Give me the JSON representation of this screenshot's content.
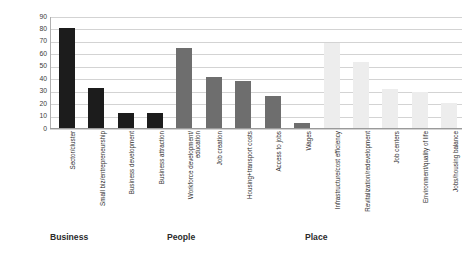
{
  "chart_data": {
    "type": "bar",
    "title": "",
    "xlabel": "",
    "ylabel": "Number of Applications",
    "ylim": [
      0,
      90
    ],
    "ytick_step": 10,
    "yticks": [
      90,
      80,
      70,
      60,
      50,
      40,
      30,
      20,
      10,
      0
    ],
    "grid": true,
    "legend": false,
    "categories": [
      "Sector/cluster",
      "Small biz/entrepreneurship",
      "Business development",
      "Business attraction",
      "Workforce development/education",
      "Job creation",
      "Housing+transport costs",
      "Access to jobs",
      "Wages",
      "Infrastructure/cost efficiency",
      "Revitalization/redevelopment",
      "Job centers",
      "Environment/quality of life",
      "Jobs/housing balance"
    ],
    "values": [
      80,
      32,
      12,
      12,
      64,
      41,
      38,
      26,
      4,
      68,
      53,
      31,
      29,
      20
    ],
    "groups": [
      {
        "name": "Business",
        "color": "#1c1c1c",
        "start_index": 0,
        "count": 4
      },
      {
        "name": "People",
        "color": "#6e6e6e",
        "start_index": 4,
        "count": 5
      },
      {
        "name": "Place",
        "color": "#ededed",
        "start_index": 9,
        "count": 5
      }
    ]
  },
  "axis": {
    "y_title": "Number of Applications"
  },
  "group_labels": [
    {
      "text": "Business"
    },
    {
      "text": "People"
    },
    {
      "text": "Place"
    }
  ]
}
